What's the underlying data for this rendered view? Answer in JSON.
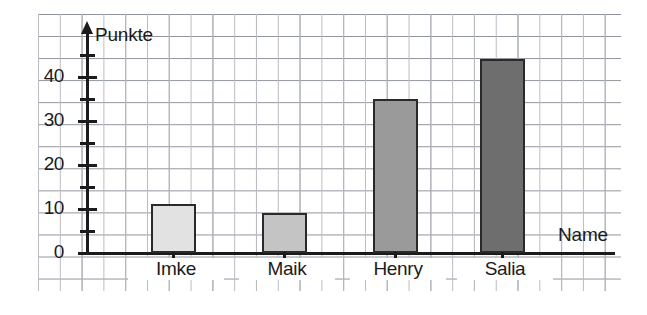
{
  "chart_data": {
    "type": "bar",
    "title": "",
    "subtitle": "",
    "xlabel": "Name",
    "ylabel": "Punkte",
    "categories": [
      "Imke",
      "Maik",
      "Henry",
      "Salia"
    ],
    "values": [
      11,
      9,
      35,
      44
    ],
    "series": [
      {
        "name": "Punkte",
        "values": [
          11,
          9,
          35,
          44
        ]
      }
    ],
    "bar_colors": [
      "#e2e2e2",
      "#c4c4c4",
      "#9a9a9a",
      "#6e6e6e"
    ],
    "bar_border_color": "#2a2a2a",
    "ylim": [
      0,
      47
    ],
    "y_major_ticks": [
      0,
      10,
      20,
      30,
      40
    ],
    "y_minor_ticks": [
      5,
      15,
      25,
      35,
      45
    ],
    "y_tick_labels": [
      "0",
      "10",
      "20",
      "30",
      "40"
    ],
    "grid": true,
    "grid_style": "graph-paper",
    "legend": "none",
    "legend_position": "none",
    "background": "#ffffff",
    "axis_color": "#1b1b1b",
    "grid_color_major": "#8d9199",
    "grid_color_minor": "#b9bcc2"
  },
  "axes": {
    "y_title": "Punkte",
    "x_title": "Name"
  },
  "icons": {
    "y_axis_arrow": "arrow-up-icon"
  }
}
